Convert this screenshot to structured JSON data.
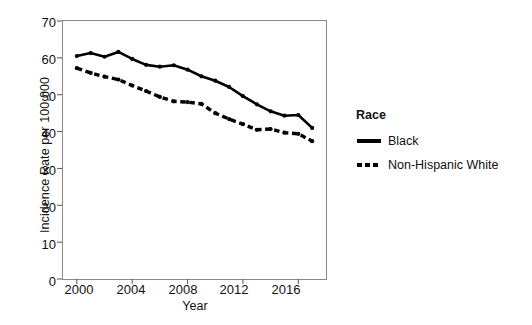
{
  "chart_data": {
    "type": "line",
    "title": "",
    "xlabel": "Year",
    "ylabel": "Incidence Rate per 100,000",
    "xlim": [
      1999,
      2018
    ],
    "ylim": [
      0,
      70
    ],
    "yticks": [
      0,
      10,
      20,
      30,
      40,
      50,
      60,
      70
    ],
    "xticks": [
      2000,
      2004,
      2008,
      2012,
      2016
    ],
    "grid": false,
    "legend": {
      "title": "Race",
      "position": "right",
      "entries": [
        "Black",
        "Non-Hispanic White"
      ]
    },
    "x": [
      2000,
      2001,
      2002,
      2003,
      2004,
      2005,
      2006,
      2007,
      2008,
      2009,
      2010,
      2011,
      2012,
      2013,
      2014,
      2015,
      2016,
      2017
    ],
    "series": [
      {
        "name": "Black",
        "style": "solid",
        "color": "#000000",
        "values": [
          60.5,
          61.3,
          60.3,
          61.6,
          59.7,
          58.1,
          57.6,
          58.0,
          56.8,
          55.0,
          53.8,
          52.1,
          49.6,
          47.4,
          45.5,
          44.3,
          44.5,
          41.0
        ]
      },
      {
        "name": "Non-Hispanic White",
        "style": "dashed",
        "color": "#000000",
        "values": [
          57.2,
          55.9,
          54.9,
          54.1,
          52.5,
          51.0,
          49.4,
          48.2,
          48.0,
          47.5,
          45.0,
          43.4,
          42.0,
          40.5,
          40.7,
          39.7,
          39.4,
          37.4
        ]
      }
    ]
  },
  "axis": {
    "yticklabels": [
      "70",
      "60",
      "50",
      "40",
      "30",
      "20",
      "10",
      "0"
    ],
    "xticklabels": [
      "2000",
      "2004",
      "2008",
      "2012",
      "2016"
    ]
  }
}
